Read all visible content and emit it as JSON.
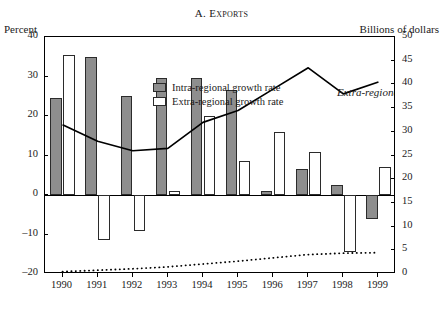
{
  "chart_data": {
    "type": "bar",
    "title": "A. Exports",
    "xlabel": "",
    "ylabel": "Percent",
    "y2label": "Billions of dollars",
    "categories": [
      "1990",
      "1991",
      "1992",
      "1993",
      "1994",
      "1995",
      "1996",
      "1997",
      "1998",
      "1999"
    ],
    "ylim": [
      -20,
      40
    ],
    "y2lim": [
      0,
      50
    ],
    "yticks": [
      40,
      30,
      20,
      10,
      0,
      -10,
      -20
    ],
    "y2ticks": [
      50,
      45,
      40,
      35,
      30,
      25,
      20,
      15,
      10,
      5,
      0
    ],
    "ytick_labels": [
      "40",
      "30",
      "20",
      "10",
      "0",
      "–10",
      "–20"
    ],
    "y2tick_labels": [
      "50",
      "45",
      "40",
      "35",
      "30",
      "25",
      "20",
      "15",
      "10",
      "5",
      "0"
    ],
    "grid": false,
    "legend_position": "upper-left-inside",
    "series": [
      {
        "name": "Intra-regional growth rate",
        "kind": "bar",
        "axis": "left",
        "color": "#8e8e8e",
        "values": [
          24.5,
          35.0,
          25.0,
          29.5,
          29.5,
          26.5,
          1.0,
          6.5,
          2.5,
          -6.0
        ]
      },
      {
        "name": "Extra-regional growth rate",
        "kind": "bar",
        "axis": "left",
        "color": "#ffffff",
        "values": [
          35.5,
          -11.5,
          -9.0,
          1.0,
          20.0,
          8.5,
          16.0,
          11.0,
          -14.5,
          7.0
        ]
      },
      {
        "name": "Extra-regional value",
        "kind": "line",
        "axis": "right",
        "style": "solid",
        "color": "#000000",
        "values": [
          31.5,
          28.0,
          26.0,
          26.5,
          32.0,
          34.5,
          39.0,
          43.5,
          38.0,
          40.5
        ]
      },
      {
        "name": "Intra-regional value",
        "kind": "line",
        "axis": "right",
        "style": "dotted",
        "color": "#000000",
        "values": [
          0.5,
          0.8,
          1.1,
          1.5,
          2.1,
          2.7,
          3.4,
          4.1,
          4.4,
          4.5
        ]
      }
    ],
    "annotations": [
      {
        "text": "Extra-regional value",
        "target": "Extra-regional value"
      },
      {
        "text": "Intra-regional value",
        "target": "Intra-regional value"
      }
    ]
  },
  "labels": {
    "title": "A. Exports",
    "left_axis_title": "Percent",
    "right_axis_title": "Billions of dollars",
    "legend_intra": "Intra-regional growth rate",
    "legend_extra": "Extra-regional growth rate",
    "annot_extra": "Extra-regional value",
    "annot_intra": "Intra-regional value"
  }
}
